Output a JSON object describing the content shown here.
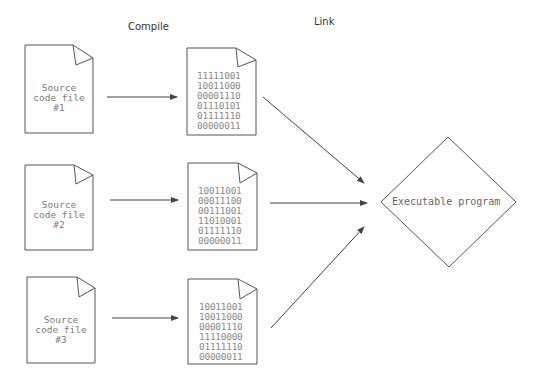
{
  "headers": {
    "compile": "Compile",
    "link": "Link"
  },
  "source_files": [
    {
      "label": "Source\ncode file\n#1"
    },
    {
      "label": "Source\ncode file\n#2"
    },
    {
      "label": "Source\ncode file\n#3"
    }
  ],
  "object_files": [
    {
      "binary": "11111001\n10011000\n00001110\n01110101\n01111110\n00000011"
    },
    {
      "binary": "10011001\n00011100\n00111001\n11010001\n01111110\n00000011"
    },
    {
      "binary": "10011001\n10011000\n00001110\n11110000\n01111110\n00000011"
    }
  ],
  "output": {
    "label": "Executable program"
  },
  "colors": {
    "stroke": "#555555",
    "text": "#7a7a7a",
    "background": "#ffffff"
  }
}
